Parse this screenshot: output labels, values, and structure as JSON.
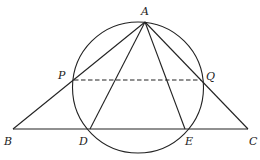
{
  "diagram": {
    "colors": {
      "stroke": "#222222",
      "background": "#ffffff"
    },
    "circle": {
      "cx": 138,
      "cy": 87.5,
      "r": 65.5
    },
    "points": {
      "A": {
        "x": 145,
        "y": 22,
        "label": "A",
        "lx": 141,
        "ly": 15
      },
      "B": {
        "x": 13,
        "y": 129,
        "label": "B",
        "lx": 4,
        "ly": 145
      },
      "C": {
        "x": 248,
        "y": 129,
        "label": "C",
        "lx": 249,
        "ly": 145
      },
      "D": {
        "x": 90,
        "y": 129,
        "label": "D",
        "lx": 79,
        "ly": 145
      },
      "E": {
        "x": 185,
        "y": 129,
        "label": "E",
        "lx": 185,
        "ly": 145
      },
      "P": {
        "x": 74,
        "y": 80,
        "label": "P",
        "lx": 58,
        "ly": 79
      },
      "Q": {
        "x": 201,
        "y": 80,
        "label": "Q",
        "lx": 206,
        "ly": 80
      }
    },
    "segments": [
      {
        "from": "A",
        "to": "B",
        "style": "solid"
      },
      {
        "from": "A",
        "to": "C",
        "style": "solid"
      },
      {
        "from": "B",
        "to": "C",
        "style": "solid"
      },
      {
        "from": "A",
        "to": "D",
        "style": "solid"
      },
      {
        "from": "A",
        "to": "E",
        "style": "solid"
      },
      {
        "from": "P",
        "to": "Q",
        "style": "dashed"
      }
    ]
  }
}
